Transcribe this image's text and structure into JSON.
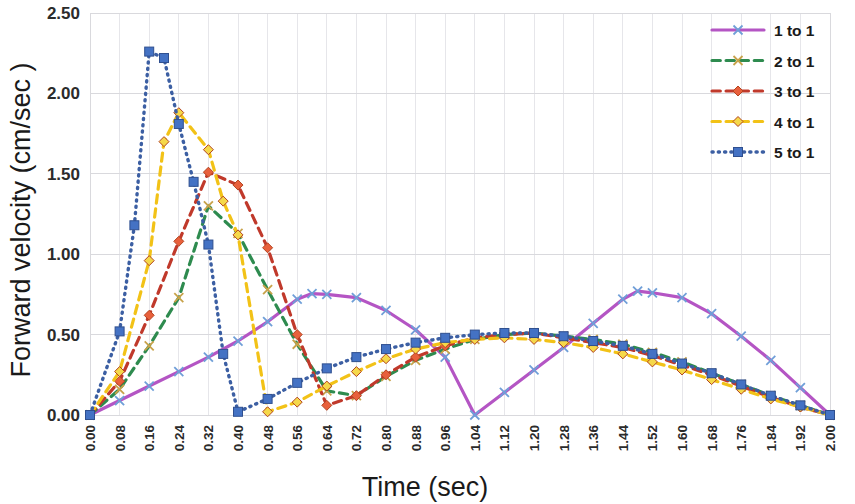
{
  "chart_data": {
    "type": "line",
    "title": "",
    "xlabel": "Time (sec)",
    "ylabel": "Forward velocity (cm/sec )",
    "xlim": [
      0.0,
      2.0
    ],
    "ylim": [
      0.0,
      2.5
    ],
    "yticks": [
      "0.00",
      "0.50",
      "1.00",
      "1.50",
      "2.00",
      "2.50"
    ],
    "ytick_values": [
      0.0,
      0.5,
      1.0,
      1.5,
      2.0,
      2.5
    ],
    "grid": true,
    "legend_position": "top-right",
    "x": [
      0.0,
      0.08,
      0.16,
      0.24,
      0.32,
      0.4,
      0.48,
      0.56,
      0.64,
      0.72,
      0.8,
      0.88,
      0.96,
      1.04,
      1.12,
      1.2,
      1.28,
      1.36,
      1.44,
      1.52,
      1.6,
      1.68,
      1.76,
      1.84,
      1.92,
      2.0
    ],
    "xtick_labels": [
      "0.00",
      "0.08",
      "0.16",
      "0.24",
      "0.32",
      "0.40",
      "0.48",
      "0.56",
      "0.64",
      "0.72",
      "0.80",
      "0.88",
      "0.96",
      "1.04",
      "1.12",
      "1.20",
      "1.28",
      "1.36",
      "1.44",
      "1.52",
      "1.60",
      "1.68",
      "1.76",
      "1.84",
      "1.92",
      "2.00"
    ],
    "series": [
      {
        "name": "1 to 1",
        "color": "#b455c4",
        "marker": "x",
        "marker_color": "#6f9fd8",
        "dash": "none",
        "values": [
          0.0,
          0.09,
          0.18,
          0.27,
          0.36,
          0.46,
          0.58,
          0.72,
          0.75,
          0.73,
          0.65,
          0.53,
          0.36,
          0.0,
          0.14,
          0.28,
          0.42,
          0.57,
          0.72,
          0.76,
          0.73,
          0.63,
          0.49,
          0.34,
          0.17,
          0.0
        ]
      },
      {
        "name": "2 to 1",
        "color": "#2e8b4f",
        "marker": "x",
        "marker_color": "#c8a24a",
        "dash": "dash",
        "values": [
          0.0,
          0.16,
          0.43,
          0.73,
          1.3,
          1.13,
          0.78,
          0.44,
          0.15,
          0.12,
          0.24,
          0.34,
          0.41,
          0.47,
          0.5,
          0.51,
          0.49,
          0.47,
          0.44,
          0.39,
          0.33,
          0.26,
          0.19,
          0.12,
          0.06,
          0.0
        ]
      },
      {
        "name": "3 to 1",
        "color": "#c0392b",
        "marker": "diamond",
        "marker_color": "#e8603c",
        "dash": "dash",
        "values": [
          0.0,
          0.21,
          0.62,
          1.08,
          1.51,
          1.43,
          1.04,
          0.5,
          0.06,
          0.12,
          0.25,
          0.36,
          0.43,
          0.48,
          0.5,
          0.51,
          0.48,
          0.45,
          0.42,
          0.37,
          0.31,
          0.25,
          0.18,
          0.11,
          0.05,
          0.0
        ]
      },
      {
        "name": "4 to 1",
        "color": "#f2c217",
        "marker": "diamond",
        "marker_color": "#f5d84a",
        "dash": "dash",
        "values": [
          0.0,
          0.27,
          0.96,
          1.88,
          1.65,
          1.12,
          0.02,
          0.08,
          0.18,
          0.27,
          0.35,
          0.41,
          0.45,
          0.47,
          0.48,
          0.47,
          0.45,
          0.42,
          0.38,
          0.33,
          0.28,
          0.22,
          0.16,
          0.1,
          0.05,
          0.0
        ]
      },
      {
        "name": "5 to 1",
        "color": "#3c5fa3",
        "marker": "square",
        "marker_color": "#4472c4",
        "dash": "dot",
        "values": [
          0.0,
          0.52,
          2.26,
          1.81,
          1.06,
          0.02,
          0.1,
          0.2,
          0.29,
          0.36,
          0.41,
          0.45,
          0.48,
          0.5,
          0.51,
          0.51,
          0.49,
          0.46,
          0.43,
          0.38,
          0.32,
          0.26,
          0.19,
          0.12,
          0.06,
          0.0
        ]
      }
    ],
    "extra_points": {
      "5 to 1": [
        [
          0.12,
          1.18
        ],
        [
          0.2,
          2.22
        ],
        [
          0.28,
          1.45
        ],
        [
          0.36,
          0.38
        ]
      ],
      "4 to 1": [
        [
          0.2,
          1.7
        ],
        [
          0.36,
          1.33
        ]
      ],
      "1 to 1": [
        [
          0.6,
          0.755
        ],
        [
          1.48,
          0.77
        ]
      ]
    }
  },
  "legend": {
    "items": [
      {
        "label": "1 to 1"
      },
      {
        "label": "2 to 1"
      },
      {
        "label": "3 to 1"
      },
      {
        "label": "4 to 1"
      },
      {
        "label": "5 to 1"
      }
    ]
  }
}
